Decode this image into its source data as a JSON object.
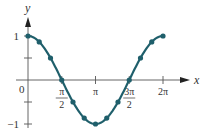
{
  "chart_data": {
    "type": "line",
    "title": "",
    "function": "y = cos x",
    "xlabel": "x",
    "ylabel": "y",
    "x": [
      0,
      0.5236,
      1.0472,
      1.5708,
      2.0944,
      2.618,
      3.1416,
      3.6652,
      4.1888,
      4.7124,
      5.236,
      5.7596,
      6.2832
    ],
    "x_labels": [
      "0",
      "π/6",
      "π/3",
      "π/2",
      "2π/3",
      "5π/6",
      "π",
      "7π/6",
      "4π/3",
      "3π/2",
      "5π/3",
      "11π/6",
      "2π"
    ],
    "series": [
      {
        "name": "cos x",
        "values": [
          1,
          0.866,
          0.5,
          0,
          -0.5,
          -0.866,
          -1,
          -0.866,
          -0.5,
          0,
          0.5,
          0.866,
          1
        ]
      }
    ],
    "xlim": [
      0,
      6.2832
    ],
    "ylim": [
      -1,
      1
    ],
    "x_ticks": [
      {
        "value": 1.5708,
        "label_num": "π",
        "label_den": "2"
      },
      {
        "value": 3.1416,
        "label": "π"
      },
      {
        "value": 4.7124,
        "label_num": "3π",
        "label_den": "2"
      },
      {
        "value": 6.2832,
        "label": "2π"
      }
    ],
    "y_ticks": [
      {
        "value": 1,
        "label": "1"
      },
      {
        "value": 0.5,
        "label": ""
      },
      {
        "value": -0.5,
        "label": ""
      },
      {
        "value": -1,
        "label": "−1"
      }
    ],
    "origin_label": "0",
    "grid": false,
    "legend": "none",
    "color": "#1f5f6b"
  }
}
